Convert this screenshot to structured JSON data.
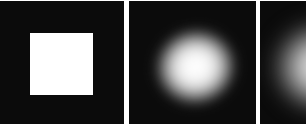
{
  "figure": {
    "panels": [
      {
        "id": 1,
        "content": "sharp white square on black background",
        "colors": {
          "background": "#0b0b0b",
          "foreground": "#ffffff"
        }
      },
      {
        "id": 2,
        "content": "blurred white square (soft blob) on black background",
        "colors": {
          "background": "#0b0b0b",
          "foreground": "#ffffff"
        }
      },
      {
        "id": 3,
        "content": "more strongly blurred blob on black background, partially cropped",
        "colors": {
          "background": "#0b0b0b",
          "foreground": "#e6e6e6"
        }
      }
    ],
    "separator_color": "#ffffff"
  }
}
